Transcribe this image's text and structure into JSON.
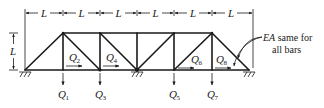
{
  "diagram": {
    "type": "continuous-truss",
    "panels": 6,
    "dimensions": {
      "panel_width_label": "L",
      "height_label": "L"
    },
    "note": {
      "italic": "EA",
      "line1_rest": " same for",
      "line2": "all bars"
    },
    "loads": [
      {
        "id": "Q1",
        "base": "Q",
        "sub": "1",
        "direction": "down",
        "node": "bottom-1"
      },
      {
        "id": "Q2",
        "base": "Q",
        "sub": "2",
        "direction": "right",
        "node": "bottom-2"
      },
      {
        "id": "Q3",
        "base": "Q",
        "sub": "3",
        "direction": "down",
        "node": "bottom-2"
      },
      {
        "id": "Q4",
        "base": "Q",
        "sub": "4",
        "direction": "right",
        "node": "bottom-3"
      },
      {
        "id": "Q5",
        "base": "Q",
        "sub": "5",
        "direction": "down",
        "node": "bottom-4"
      },
      {
        "id": "Q6",
        "base": "Q",
        "sub": "6",
        "direction": "right",
        "node": "bottom-5"
      },
      {
        "id": "Q7",
        "base": "Q",
        "sub": "7",
        "direction": "down",
        "node": "bottom-5"
      },
      {
        "id": "Q8",
        "base": "Q",
        "sub": "8",
        "direction": "right",
        "node": "bottom-6"
      }
    ],
    "supports": [
      {
        "node": "bottom-0",
        "type": "pin"
      },
      {
        "node": "bottom-3",
        "type": "pin"
      },
      {
        "node": "bottom-6",
        "type": "pin"
      }
    ]
  }
}
